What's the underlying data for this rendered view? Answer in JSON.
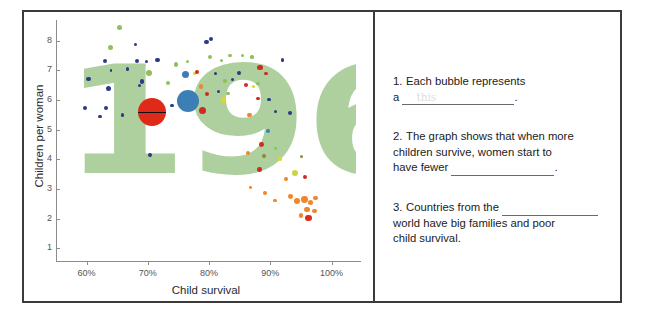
{
  "worksheet": {
    "chart": {
      "y_axis_title": "Children per woman",
      "x_axis_title": "Child survival",
      "watermark": "1960",
      "watermark_color": "#aed09f",
      "y_ticks": [
        "8",
        "7",
        "6",
        "5",
        "4",
        "3",
        "2",
        "1"
      ],
      "x_ticks": [
        "60%",
        "70%",
        "80%",
        "90%",
        "100%"
      ]
    },
    "questions": [
      {
        "number": "1.",
        "text_before": "Each bubble represents a",
        "line1": "Each bubble represents",
        "line2_prefix": "a",
        "line2_suffix": ".",
        "blank_ghost": "this"
      },
      {
        "number": "2.",
        "line1": "The graph shows that when more",
        "line2": "children survive, women start to",
        "line3_prefix": "have fewer",
        "line3_suffix": ".",
        "blank_ghost": ""
      },
      {
        "number": "3.",
        "line1_prefix": "Countries from the",
        "line2": "world have big families and poor",
        "line3": "child survival.",
        "blank_ghost": ""
      }
    ]
  },
  "chart_data": {
    "type": "scatter",
    "title": "1960",
    "xlabel": "Child survival",
    "ylabel": "Children per woman",
    "xlim": [
      55,
      104
    ],
    "ylim": [
      0.6,
      8.7
    ],
    "x_tick_values": [
      60,
      70,
      80,
      90,
      100
    ],
    "x_tick_labels": [
      "60%",
      "70%",
      "80%",
      "90%",
      "100%"
    ],
    "y_tick_values": [
      1,
      2,
      3,
      4,
      5,
      6,
      7,
      8
    ],
    "y_tick_labels": [
      "8",
      "7",
      "6",
      "5",
      "4",
      "3",
      "2",
      "1"
    ],
    "grid": false,
    "legend": false,
    "size_encodes": "population",
    "color_encodes": "world region",
    "region_colors": {
      "africa": "#2b3a87",
      "asia": "#cf2b22",
      "americas": "#8fc05a",
      "europe": "#f0852a",
      "yellow": "#e0d629",
      "olive": "#8d8a33",
      "teal": "#3b7fb5"
    },
    "highlighted_points": [
      {
        "label": "India",
        "x": 70.6,
        "y": 5.6,
        "r": 14,
        "color": "#e02a19",
        "has_line": true
      },
      {
        "label": "China",
        "x": 76.6,
        "y": 5.95,
        "r": 11,
        "color": "#3b7fb5"
      }
    ],
    "points": [
      {
        "x": 65.4,
        "y": 8.45,
        "r": 2.6,
        "c": "#8fc05a"
      },
      {
        "x": 63.9,
        "y": 7.78,
        "r": 2.6,
        "c": "#8fc05a"
      },
      {
        "x": 68.0,
        "y": 7.88,
        "r": 1.6,
        "c": "#2b3a87"
      },
      {
        "x": 63.0,
        "y": 7.32,
        "r": 2.0,
        "c": "#2b3a87"
      },
      {
        "x": 64.0,
        "y": 7.0,
        "r": 1.4,
        "c": "#2b3a87"
      },
      {
        "x": 66.7,
        "y": 7.05,
        "r": 1.8,
        "c": "#2b3a87"
      },
      {
        "x": 68.2,
        "y": 7.32,
        "r": 2.2,
        "c": "#2b3a87"
      },
      {
        "x": 69.8,
        "y": 7.3,
        "r": 1.5,
        "c": "#2b3a87"
      },
      {
        "x": 71.6,
        "y": 7.35,
        "r": 2.2,
        "c": "#2b3a87"
      },
      {
        "x": 60.3,
        "y": 6.7,
        "r": 2.1,
        "c": "#2b3a87"
      },
      {
        "x": 63.6,
        "y": 6.4,
        "r": 2.6,
        "c": "#2b3a87"
      },
      {
        "x": 59.8,
        "y": 5.73,
        "r": 2.1,
        "c": "#2b3a87"
      },
      {
        "x": 63.2,
        "y": 5.72,
        "r": 1.9,
        "c": "#2b3a87"
      },
      {
        "x": 62.2,
        "y": 5.45,
        "r": 1.7,
        "c": "#2b3a87"
      },
      {
        "x": 65.9,
        "y": 5.5,
        "r": 1.7,
        "c": "#2b3a87"
      },
      {
        "x": 69.0,
        "y": 6.62,
        "r": 2.2,
        "c": "#2b3a87"
      },
      {
        "x": 68.6,
        "y": 6.48,
        "r": 1.6,
        "c": "#2b3a87"
      },
      {
        "x": 70.2,
        "y": 6.9,
        "r": 3.0,
        "c": "#8fc05a"
      },
      {
        "x": 73.3,
        "y": 6.58,
        "r": 2.1,
        "c": "#8fc05a"
      },
      {
        "x": 74.6,
        "y": 7.2,
        "r": 2.3,
        "c": "#8fc05a"
      },
      {
        "x": 76.5,
        "y": 7.3,
        "r": 1.8,
        "c": "#8fc05a"
      },
      {
        "x": 73.9,
        "y": 5.82,
        "r": 1.8,
        "c": "#2b3a87"
      },
      {
        "x": 70.4,
        "y": 4.14,
        "r": 2.0,
        "c": "#2b3a87"
      },
      {
        "x": 76.1,
        "y": 6.85,
        "r": 3.6,
        "c": "#3b7fb5"
      },
      {
        "x": 77.6,
        "y": 6.9,
        "r": 1.8,
        "c": "#e0d629"
      },
      {
        "x": 78.0,
        "y": 6.95,
        "r": 2.3,
        "c": "#cf2b22"
      },
      {
        "x": 78.7,
        "y": 6.45,
        "r": 2.4,
        "c": "#f0852a"
      },
      {
        "x": 78.9,
        "y": 5.65,
        "r": 3.7,
        "c": "#cf2b22"
      },
      {
        "x": 79.7,
        "y": 6.2,
        "r": 2.2,
        "c": "#cf2b22"
      },
      {
        "x": 80.3,
        "y": 8.05,
        "r": 2.2,
        "c": "#2b3a87"
      },
      {
        "x": 79.6,
        "y": 7.95,
        "r": 2.2,
        "c": "#2b3a87"
      },
      {
        "x": 80.2,
        "y": 7.45,
        "r": 2.1,
        "c": "#8fc05a"
      },
      {
        "x": 81.0,
        "y": 6.9,
        "r": 1.6,
        "c": "#2b3a87"
      },
      {
        "x": 82.0,
        "y": 7.35,
        "r": 1.5,
        "c": "#8fc05a"
      },
      {
        "x": 83.4,
        "y": 7.5,
        "r": 1.8,
        "c": "#8fc05a"
      },
      {
        "x": 82.6,
        "y": 6.65,
        "r": 1.8,
        "c": "#8fc05a"
      },
      {
        "x": 83.8,
        "y": 6.7,
        "r": 1.5,
        "c": "#2b3a87"
      },
      {
        "x": 81.6,
        "y": 6.3,
        "r": 1.5,
        "c": "#2b3a87"
      },
      {
        "x": 82.4,
        "y": 6.0,
        "r": 2.7,
        "c": "#e0d629"
      },
      {
        "x": 83.1,
        "y": 6.22,
        "r": 1.8,
        "c": "#8fc05a"
      },
      {
        "x": 84.9,
        "y": 6.9,
        "r": 1.9,
        "c": "#2b3a87"
      },
      {
        "x": 86.1,
        "y": 6.5,
        "r": 2.1,
        "c": "#cf2b22"
      },
      {
        "x": 85.4,
        "y": 7.5,
        "r": 1.5,
        "c": "#8fc05a"
      },
      {
        "x": 87.0,
        "y": 7.45,
        "r": 1.6,
        "c": "#8fc05a"
      },
      {
        "x": 88.3,
        "y": 7.1,
        "r": 2.8,
        "c": "#cf2b22"
      },
      {
        "x": 89.3,
        "y": 6.9,
        "r": 1.6,
        "c": "#cf2b22"
      },
      {
        "x": 88.0,
        "y": 6.55,
        "r": 1.8,
        "c": "#8fc05a"
      },
      {
        "x": 87.3,
        "y": 6.45,
        "r": 1.6,
        "c": "#e0d629"
      },
      {
        "x": 86.6,
        "y": 5.5,
        "r": 2.1,
        "c": "#f0852a"
      },
      {
        "x": 88.0,
        "y": 6.05,
        "r": 1.9,
        "c": "#cf2b22"
      },
      {
        "x": 89.8,
        "y": 6.02,
        "r": 1.6,
        "c": "#2b3a87"
      },
      {
        "x": 90.9,
        "y": 5.6,
        "r": 1.6,
        "c": "#2b3a87"
      },
      {
        "x": 92.0,
        "y": 7.35,
        "r": 1.6,
        "c": "#2b3a87"
      },
      {
        "x": 93.3,
        "y": 5.55,
        "r": 2.0,
        "c": "#2b3a87"
      },
      {
        "x": 89.6,
        "y": 4.95,
        "r": 1.9,
        "c": "#3b7fb5"
      },
      {
        "x": 88.6,
        "y": 4.5,
        "r": 2.4,
        "c": "#cf2b22"
      },
      {
        "x": 90.8,
        "y": 4.35,
        "r": 1.4,
        "c": "#8fc05a"
      },
      {
        "x": 86.4,
        "y": 4.2,
        "r": 2.0,
        "c": "#f0852a"
      },
      {
        "x": 89.0,
        "y": 4.1,
        "r": 2.1,
        "c": "#8d8a33"
      },
      {
        "x": 88.2,
        "y": 3.65,
        "r": 2.3,
        "c": "#cf2b22"
      },
      {
        "x": 91.6,
        "y": 4.0,
        "r": 1.8,
        "c": "#e0d629"
      },
      {
        "x": 95.1,
        "y": 4.1,
        "r": 1.7,
        "c": "#8d8a33"
      },
      {
        "x": 94.0,
        "y": 3.55,
        "r": 3.0,
        "c": "#c8d645"
      },
      {
        "x": 95.6,
        "y": 3.4,
        "r": 2.0,
        "c": "#cf2b22"
      },
      {
        "x": 92.5,
        "y": 3.35,
        "r": 2.0,
        "c": "#f0852a"
      },
      {
        "x": 86.8,
        "y": 3.05,
        "r": 1.4,
        "c": "#f0852a"
      },
      {
        "x": 89.2,
        "y": 2.85,
        "r": 1.9,
        "c": "#f0852a"
      },
      {
        "x": 90.8,
        "y": 2.6,
        "r": 1.7,
        "c": "#f0852a"
      },
      {
        "x": 93.3,
        "y": 2.75,
        "r": 2.4,
        "c": "#f0852a"
      },
      {
        "x": 94.4,
        "y": 2.6,
        "r": 3.0,
        "c": "#f0852a"
      },
      {
        "x": 95.6,
        "y": 2.65,
        "r": 3.4,
        "c": "#f0852a"
      },
      {
        "x": 96.6,
        "y": 2.55,
        "r": 2.6,
        "c": "#f0852a"
      },
      {
        "x": 97.4,
        "y": 2.7,
        "r": 2.2,
        "c": "#f0852a"
      },
      {
        "x": 96.0,
        "y": 2.3,
        "r": 2.6,
        "c": "#f0852a"
      },
      {
        "x": 97.2,
        "y": 2.25,
        "r": 2.2,
        "c": "#f0852a"
      },
      {
        "x": 95.0,
        "y": 2.1,
        "r": 2.2,
        "c": "#f0852a"
      },
      {
        "x": 96.2,
        "y": 2.02,
        "r": 3.4,
        "c": "#e02a19"
      }
    ]
  }
}
